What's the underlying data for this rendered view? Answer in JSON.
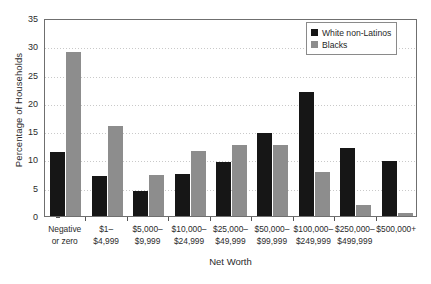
{
  "chart_data": {
    "type": "bar",
    "title": "",
    "xlabel": "Net Worth",
    "ylabel": "Percentage of Households",
    "ylim": [
      0,
      35
    ],
    "yticks": [
      0,
      5,
      10,
      15,
      20,
      25,
      30,
      35
    ],
    "grid": true,
    "legend_position": "top-right",
    "categories": [
      "Negative or zero",
      "$1–$4,999",
      "$5,000–$9,999",
      "$10,000–$24,999",
      "$25,000–$49,999",
      "$50,000–$99,999",
      "$100,000–$249,999",
      "$250,000–$499,999",
      "$500,000+"
    ],
    "category_lines": [
      [
        "Negative",
        "or zero"
      ],
      [
        "$1–",
        "$4,999"
      ],
      [
        "$5,000–",
        "$9,999"
      ],
      [
        "$10,000–",
        "$24,999"
      ],
      [
        "$25,000–",
        "$49,999"
      ],
      [
        "$50,000–",
        "$99,999"
      ],
      [
        "$100,000–",
        "$249,999"
      ],
      [
        "$250,000–",
        "$499,999"
      ],
      [
        "$500,000+",
        ""
      ]
    ],
    "series": [
      {
        "name": "White non-Latinos",
        "color": "#161616",
        "values": [
          11.3,
          7.1,
          4.5,
          7.5,
          9.6,
          14.7,
          22.0,
          12.1,
          9.8
        ]
      },
      {
        "name": "Blacks",
        "color": "#8d8d8d",
        "values": [
          29.0,
          15.9,
          7.2,
          11.5,
          12.6,
          12.5,
          7.8,
          2.0,
          0.5
        ]
      }
    ]
  },
  "legend": {
    "items": [
      {
        "label": "White non-Latinos",
        "color": "#161616"
      },
      {
        "label": "Blacks",
        "color": "#8d8d8d"
      }
    ]
  }
}
